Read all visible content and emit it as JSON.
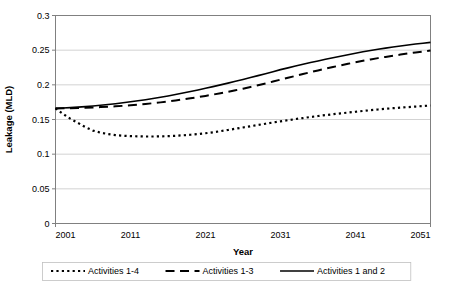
{
  "chart_data": {
    "type": "line",
    "title": "",
    "xlabel": "Year",
    "ylabel": "Leakage (MLD)",
    "xlim": [
      2001,
      2051
    ],
    "ylim": [
      0,
      0.3
    ],
    "grid": true,
    "legend_position": "bottom",
    "x_ticks": [
      "2001",
      "2011",
      "2021",
      "2031",
      "2041",
      "2051"
    ],
    "x_tick_values": [
      2001,
      2011,
      2021,
      2031,
      2041,
      2051
    ],
    "y_ticks": [
      "0",
      "0.05",
      "0.1",
      "0.15",
      "0.2",
      "0.25",
      "0.3"
    ],
    "y_tick_values": [
      0,
      0.05,
      0.1,
      0.15,
      0.2,
      0.25,
      0.3
    ],
    "x": [
      2001,
      2002,
      2003,
      2004,
      2005,
      2006,
      2007,
      2008,
      2009,
      2010,
      2011,
      2012,
      2013,
      2014,
      2015,
      2016,
      2017,
      2018,
      2019,
      2020,
      2021,
      2022,
      2023,
      2024,
      2025,
      2026,
      2027,
      2028,
      2029,
      2030,
      2031,
      2032,
      2033,
      2034,
      2035,
      2036,
      2037,
      2038,
      2039,
      2040,
      2041,
      2042,
      2043,
      2044,
      2045,
      2046,
      2047,
      2048,
      2049,
      2050,
      2051
    ],
    "series": [
      {
        "name": "Activities 1-4",
        "style": "dotted",
        "values": [
          0.166,
          0.158,
          0.151,
          0.145,
          0.139,
          0.134,
          0.131,
          0.129,
          0.1275,
          0.1265,
          0.126,
          0.1257,
          0.1255,
          0.1255,
          0.1257,
          0.126,
          0.1265,
          0.1272,
          0.128,
          0.129,
          0.1302,
          0.1316,
          0.1332,
          0.1349,
          0.1367,
          0.1385,
          0.1403,
          0.1421,
          0.1439,
          0.1457,
          0.1474,
          0.149,
          0.1506,
          0.1521,
          0.1536,
          0.155,
          0.1563,
          0.1576,
          0.1588,
          0.16,
          0.1612,
          0.1623,
          0.1634,
          0.1644,
          0.1654,
          0.1663,
          0.1671,
          0.1679,
          0.1687,
          0.1694,
          0.1702
        ]
      },
      {
        "name": "Activities 1-3",
        "style": "dashed",
        "values": [
          0.166,
          0.1662,
          0.1664,
          0.1667,
          0.167,
          0.1674,
          0.1679,
          0.1684,
          0.169,
          0.1697,
          0.1705,
          0.1714,
          0.1724,
          0.1735,
          0.1747,
          0.176,
          0.1774,
          0.1789,
          0.1805,
          0.1822,
          0.184,
          0.1859,
          0.1879,
          0.19,
          0.1922,
          0.1945,
          0.1969,
          0.1994,
          0.202,
          0.2047,
          0.2075,
          0.2102,
          0.2129,
          0.2156,
          0.2182,
          0.2208,
          0.2233,
          0.2257,
          0.228,
          0.2303,
          0.2325,
          0.2346,
          0.2366,
          0.2385,
          0.2403,
          0.242,
          0.2436,
          0.2452,
          0.2467,
          0.2481,
          0.2495
        ]
      },
      {
        "name": "Activities 1 and 2",
        "style": "solid",
        "values": [
          0.166,
          0.1665,
          0.1671,
          0.1678,
          0.1686,
          0.1695,
          0.1705,
          0.1716,
          0.1728,
          0.1741,
          0.1755,
          0.177,
          0.1786,
          0.1803,
          0.1821,
          0.184,
          0.186,
          0.1881,
          0.1903,
          0.1926,
          0.195,
          0.1974,
          0.1999,
          0.2025,
          0.2051,
          0.2078,
          0.2105,
          0.2133,
          0.2161,
          0.219,
          0.2219,
          0.2245,
          0.2271,
          0.2296,
          0.2321,
          0.2345,
          0.2368,
          0.2391,
          0.2413,
          0.2435,
          0.2456,
          0.2476,
          0.2495,
          0.2513,
          0.253,
          0.2546,
          0.2561,
          0.2575,
          0.2588,
          0.26,
          0.2612
        ]
      }
    ],
    "colors": {
      "series_line": "#000000",
      "gridline": "#c8c8c8",
      "axis": "#808080",
      "background": "#ffffff"
    }
  },
  "legend": {
    "items": [
      {
        "label": "Activities 1-4"
      },
      {
        "label": "Activities 1-3"
      },
      {
        "label": "Activities 1 and 2"
      }
    ]
  }
}
